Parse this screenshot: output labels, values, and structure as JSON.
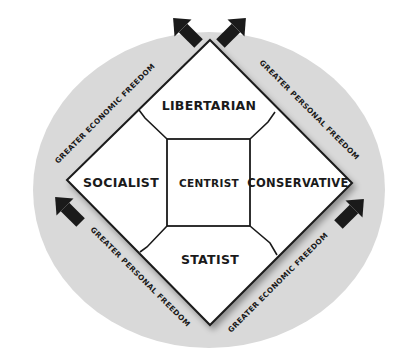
{
  "diagram": {
    "type": "nolan-chart",
    "colors": {
      "background": "#ffffff",
      "ellipse": "#d9d9d9",
      "diamond_fill": "#ffffff",
      "stroke": "#1a1a1a",
      "arrow": "#1a1a1a"
    },
    "regions": {
      "top": "LIBERTARIAN",
      "left": "SOCIALIST",
      "center": "CENTRIST",
      "right": "CONSERVATIVE",
      "bottom": "STATIST"
    },
    "axes": {
      "upper_left": "GREATER ECONOMIC FREEDOM",
      "upper_right": "GREATER PERSONAL FREEDOM",
      "lower_left": "GREATER PERSONAL FREEDOM",
      "lower_right": "GREATER ECONOMIC FREEDOM"
    }
  }
}
